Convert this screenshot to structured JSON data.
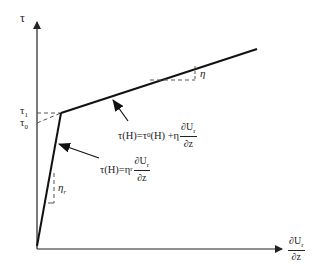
{
  "diagram": {
    "type": "bilinear-rheology-plot",
    "y_axis_label": "τ",
    "x_axis_label": {
      "numerator": "∂U",
      "numerator_sub": "r",
      "denominator": "∂z"
    },
    "tick_labels": [
      {
        "text": "τ",
        "sub": "1"
      },
      {
        "text": "τ",
        "sub": "0"
      }
    ],
    "slope_labels": [
      {
        "text": "η",
        "sub": ""
      },
      {
        "text": "η",
        "sub": "r"
      }
    ],
    "equations": {
      "upper": {
        "lhs": "τ(H)=τ",
        "lhs_sub": "0",
        "mid": "(H) +η",
        "num": "∂U",
        "num_sub": "r",
        "den": "∂z"
      },
      "lower": {
        "lhs": "τ(H)=η",
        "lhs_sub": "r",
        "num": "∂U",
        "num_sub": "r",
        "den": "∂z"
      }
    },
    "colors": {
      "line": "#222222",
      "dash": "#555555",
      "background": "#ffffff"
    }
  }
}
